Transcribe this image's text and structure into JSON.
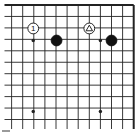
{
  "diagram": {
    "type": "go-board-corner",
    "corner": "top-right",
    "columns_visible": 12,
    "rows_visible": 11,
    "colors": {
      "background": "#ffffff",
      "line": "#222222",
      "black_stone": "#111111",
      "white_stone": "#ffffff"
    },
    "hoshi": [
      {
        "col": 2,
        "row": 3
      },
      {
        "col": 8,
        "row": 3
      },
      {
        "col": 2,
        "row": 9
      }
    ],
    "extra_hoshi": [
      {
        "col": 8,
        "row": 9
      }
    ],
    "stones": [
      {
        "color": "white",
        "col": 2,
        "row": 2,
        "label": "1",
        "marker": "number"
      },
      {
        "color": "black",
        "col": 4,
        "row": 3,
        "label": "",
        "marker": "none"
      },
      {
        "color": "white",
        "col": 7,
        "row": 2,
        "label": "",
        "marker": "triangle"
      },
      {
        "color": "black",
        "col": 9,
        "row": 3,
        "label": "",
        "marker": "none"
      }
    ]
  }
}
